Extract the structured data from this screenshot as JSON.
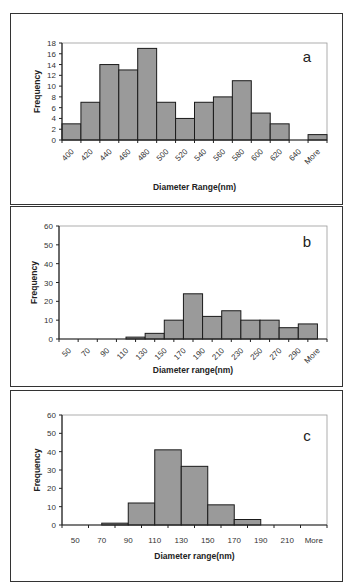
{
  "chart_data": [
    {
      "type": "bar",
      "panel_label": "a",
      "title": "",
      "xlabel": "Diameter Range(nm)",
      "ylabel": "Frequency",
      "categories": [
        "400",
        "420",
        "440",
        "460",
        "480",
        "500",
        "520",
        "540",
        "560",
        "580",
        "600",
        "620",
        "640",
        "More"
      ],
      "values": [
        3,
        7,
        14,
        13,
        17,
        7,
        4,
        7,
        8,
        11,
        5,
        3,
        0,
        1
      ],
      "ylim": [
        0,
        18
      ],
      "yticks": [
        0,
        2,
        4,
        6,
        8,
        10,
        12,
        14,
        16,
        18
      ],
      "xtick_rotation": -45,
      "bar_offset": 0,
      "grid": false,
      "legend": null
    },
    {
      "type": "bar",
      "panel_label": "b",
      "title": "",
      "xlabel": "Diameter range(nm)",
      "ylabel": "Frequency",
      "categories": [
        "50",
        "70",
        "90",
        "110",
        "130",
        "150",
        "170",
        "190",
        "210",
        "230",
        "250",
        "270",
        "290",
        "More"
      ],
      "values": [
        0,
        0,
        0,
        1,
        3,
        10,
        24,
        12,
        15,
        10,
        10,
        6,
        8,
        0
      ],
      "ylim": [
        0,
        60
      ],
      "yticks": [
        0,
        10,
        20,
        30,
        40,
        50,
        60
      ],
      "xtick_rotation": -45,
      "bar_offset": 0.5,
      "grid": false,
      "legend": null
    },
    {
      "type": "bar",
      "panel_label": "c",
      "title": "",
      "xlabel": "Diameter range(nm)",
      "ylabel": "Frequency",
      "categories": [
        "50",
        "70",
        "90",
        "110",
        "130",
        "150",
        "170",
        "190",
        "210",
        "More"
      ],
      "values": [
        0,
        1,
        12,
        41,
        32,
        11,
        3,
        0,
        0,
        0
      ],
      "ylim": [
        0,
        60
      ],
      "yticks": [
        0,
        10,
        20,
        30,
        40,
        50,
        60
      ],
      "xtick_rotation": 0,
      "bar_offset": 0.5,
      "grid": false,
      "legend": null
    }
  ],
  "style": {
    "bar_fill": "#9a9a9a",
    "bar_stroke": "#1a1a1a",
    "axis_color": "#222222",
    "frame_color": "#999999"
  }
}
